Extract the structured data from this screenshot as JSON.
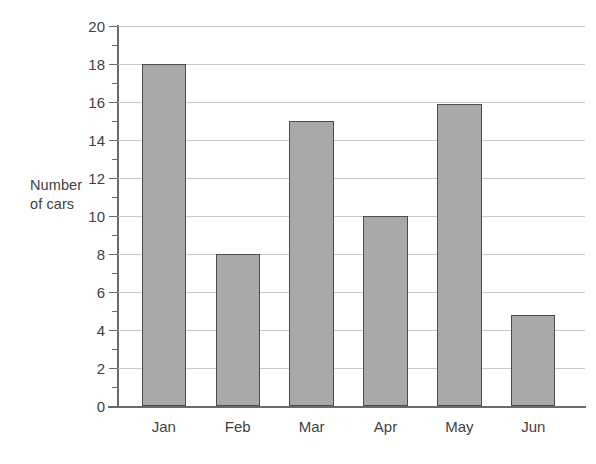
{
  "chart_data": {
    "type": "bar",
    "title": "",
    "subtitle": "",
    "xlabel": "",
    "ylabel": "Number\nof cars",
    "categories": [
      "Jan",
      "Feb",
      "Mar",
      "Apr",
      "May",
      "Jun"
    ],
    "values": [
      18,
      8,
      15,
      10,
      15.9,
      4.8
    ],
    "series": [
      {
        "name": "Number of cars",
        "values": [
          18,
          8,
          15,
          10,
          15.9,
          4.8
        ]
      }
    ],
    "ylim": [
      0,
      20
    ],
    "y_major_ticks": [
      0,
      2,
      4,
      6,
      8,
      10,
      12,
      14,
      16,
      18,
      20
    ],
    "y_minor_ticks": [
      1,
      3,
      5,
      7,
      9,
      11,
      13,
      15,
      17,
      19
    ],
    "y_tick_labels": [
      "0",
      "2",
      "4",
      "6",
      "8",
      "10",
      "12",
      "14",
      "16",
      "18",
      "20"
    ],
    "grid": true,
    "grid_axis": "y",
    "legend": false,
    "legend_position": "none",
    "annotations": [],
    "colors": {
      "bar_fill": "#a9a9a9",
      "bar_outline": "#4c4c4c",
      "gridline": "#c9c9c9",
      "axis": "#6a6a6a",
      "text": "#3f3f3f",
      "background": "#ffffff"
    }
  }
}
